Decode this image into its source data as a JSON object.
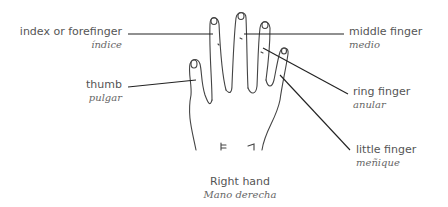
{
  "labels": {
    "index": {
      "en": "index or forefinger",
      "es": "índice"
    },
    "thumb": {
      "en": "thumb",
      "es": "pulgar"
    },
    "middle": {
      "en": "middle finger",
      "es": "medio"
    },
    "ring": {
      "en": "ring finger",
      "es": "anular"
    },
    "little": {
      "en": "little finger",
      "es": "meñique"
    }
  },
  "caption": {
    "en": "Right hand",
    "es": "Mano derecha"
  },
  "colors": {
    "line": "#222222",
    "text": "#555555"
  }
}
